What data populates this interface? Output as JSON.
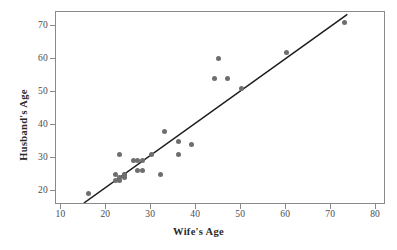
{
  "chart": {
    "type": "scatter",
    "title": "",
    "xlabel": "Wife's Age",
    "ylabel": "Husband's Age"
  },
  "chart_data": {
    "type": "scatter",
    "title": "",
    "subtitle": "",
    "xlabel": "Wife's Age",
    "ylabel": "Husband's Age",
    "xlim": [
      8.8,
      82.2
    ],
    "ylim": [
      15.6,
      74.2
    ],
    "xticks": [
      10,
      20,
      30,
      40,
      50,
      60,
      70,
      80
    ],
    "yticks": [
      20,
      30,
      40,
      50,
      60,
      70
    ],
    "xtick_labels": [
      "10",
      "20",
      "30",
      "40",
      "50",
      "60",
      "70",
      "80"
    ],
    "ytick_labels": [
      "20",
      "30",
      "40",
      "50",
      "60",
      "70"
    ],
    "grid": false,
    "legend": null,
    "legend_position": "none",
    "marker": {
      "shape": "circle",
      "color": "#6e6e6e",
      "size": 5
    },
    "series": [
      {
        "name": "Couples",
        "type": "scatter",
        "points": [
          [
            16,
            19
          ],
          [
            22,
            25
          ],
          [
            22,
            23
          ],
          [
            23,
            31
          ],
          [
            23,
            23
          ],
          [
            23,
            24
          ],
          [
            24,
            25
          ],
          [
            24,
            25
          ],
          [
            24,
            24
          ],
          [
            26,
            29
          ],
          [
            27,
            29
          ],
          [
            27,
            26
          ],
          [
            28,
            29
          ],
          [
            28,
            26
          ],
          [
            30,
            31
          ],
          [
            32,
            25
          ],
          [
            33,
            38
          ],
          [
            36,
            35
          ],
          [
            36,
            31
          ],
          [
            39,
            34
          ],
          [
            44,
            54
          ],
          [
            45,
            60
          ],
          [
            47,
            54
          ],
          [
            50,
            51
          ],
          [
            60,
            62
          ],
          [
            73,
            71
          ]
        ]
      },
      {
        "name": "Fitted line",
        "type": "line",
        "color": "#1c1c1c",
        "endpoints": [
          [
            15.0,
            16.2
          ],
          [
            73.6,
            73.5
          ]
        ]
      }
    ]
  },
  "axes": {
    "x": {
      "ticks": [
        {
          "value": 10,
          "label": "10"
        },
        {
          "value": 20,
          "label": "20"
        },
        {
          "value": 30,
          "label": "30"
        },
        {
          "value": 40,
          "label": "40"
        },
        {
          "value": 50,
          "label": "50"
        },
        {
          "value": 60,
          "label": "60"
        },
        {
          "value": 70,
          "label": "70"
        },
        {
          "value": 80,
          "label": "80"
        }
      ]
    },
    "y": {
      "ticks": [
        {
          "value": 20,
          "label": "20"
        },
        {
          "value": 30,
          "label": "30"
        },
        {
          "value": 40,
          "label": "40"
        },
        {
          "value": 50,
          "label": "50"
        },
        {
          "value": 60,
          "label": "60"
        },
        {
          "value": 70,
          "label": "70"
        }
      ]
    }
  },
  "colors": {
    "marker": "#6e6e6e",
    "line": "#1c1c1c",
    "frame": "#8a8a8a",
    "tick_label": "#4a4a4a",
    "axis_title": "#2b2b2b",
    "background": "#ffffff"
  }
}
